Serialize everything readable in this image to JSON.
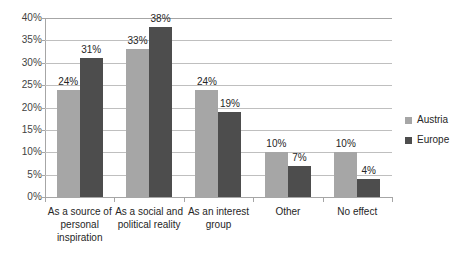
{
  "chart_data": {
    "type": "bar",
    "title": "",
    "subtitle": "",
    "xlabel": "",
    "ylabel": "",
    "ylim": [
      0,
      40
    ],
    "ytick_labels": [
      "40%",
      "35%",
      "30%",
      "25%",
      "20%",
      "15%",
      "10%",
      "5%",
      "0%"
    ],
    "ytick_values": [
      40,
      35,
      30,
      25,
      20,
      15,
      10,
      5,
      0
    ],
    "grid": true,
    "legend_position": "right",
    "categories": [
      "As a source of personal inspiration",
      "As a social and political reality",
      "As an interest group",
      "Other",
      "No effect"
    ],
    "category_lines": [
      [
        "As a source of",
        "personal",
        "inspiration"
      ],
      [
        "As a social and",
        "political reality"
      ],
      [
        "As an interest",
        "group"
      ],
      [
        "Other"
      ],
      [
        "No effect"
      ]
    ],
    "series": [
      {
        "name": "Austria",
        "color": "#a6a6a6",
        "values": [
          24,
          33,
          24,
          10,
          10
        ],
        "labels": [
          "24%",
          "33%",
          "24%",
          "10%",
          "10%"
        ]
      },
      {
        "name": "Europe",
        "color": "#4d4d4d",
        "values": [
          31,
          38,
          19,
          7,
          4
        ],
        "labels": [
          "31%",
          "38%",
          "19%",
          "7%",
          "4%"
        ]
      }
    ]
  },
  "legend": {
    "items": [
      {
        "label": "Austria",
        "color": "#a6a6a6"
      },
      {
        "label": "Europe",
        "color": "#4d4d4d"
      }
    ]
  },
  "colors": {
    "austria": "#a6a6a6",
    "europe": "#4d4d4d",
    "gridline": "#bfbfbf",
    "axis": "#a6a6a6",
    "background": "#ffffff",
    "text": "#262626"
  }
}
